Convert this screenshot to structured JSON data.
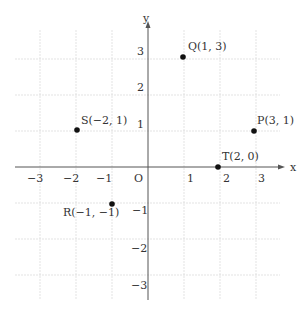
{
  "axes": {
    "x_label": "x",
    "y_label": "y",
    "origin_label": "O"
  },
  "x_ticks": [
    {
      "label": "−3",
      "x": 40
    },
    {
      "label": "−2",
      "x": 76
    },
    {
      "label": "−1",
      "x": 112
    },
    {
      "label": "1",
      "x": 184
    },
    {
      "label": "2",
      "x": 220
    },
    {
      "label": "3",
      "x": 256
    }
  ],
  "y_ticks": [
    {
      "label": "3",
      "y": 59
    },
    {
      "label": "2",
      "y": 95
    },
    {
      "label": "1",
      "y": 131
    },
    {
      "label": "−1",
      "y": 203
    },
    {
      "label": "−2",
      "y": 239
    },
    {
      "label": "−3",
      "y": 275
    }
  ],
  "points": [
    {
      "name": "Q",
      "label": "Q(1, 3)"
    },
    {
      "name": "S",
      "label": "S(−2, 1)"
    },
    {
      "name": "P",
      "label": "P(3, 1)"
    },
    {
      "name": "T",
      "label": "T(2, 0)"
    },
    {
      "name": "R",
      "label": "R(−1, −1)"
    }
  ],
  "colors": {
    "grid": "#d8d8d8",
    "axis": "#555555",
    "point": "#111111"
  }
}
